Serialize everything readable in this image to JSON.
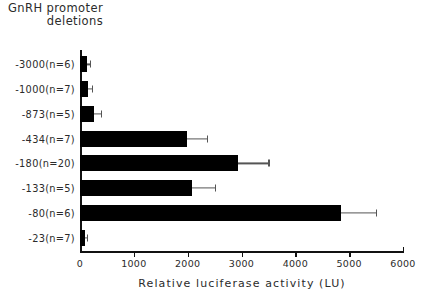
{
  "chart_data": {
    "type": "bar",
    "orientation": "horizontal",
    "title": "GnRH promoter deletions",
    "title_line1": "GnRH  promoter",
    "title_line2": "deletions",
    "xlabel": "Relative  luciferase  activity  (LU)",
    "ylabel": "",
    "xlim": [
      0,
      6000
    ],
    "xticks": [
      0,
      1000,
      2000,
      3000,
      4000,
      5000,
      6000
    ],
    "xtick_labels": [
      "0",
      "1000",
      "2000",
      "3000",
      "4000",
      "5000",
      "6000"
    ],
    "grid": false,
    "legend": null,
    "bar_color": "#000000",
    "error_color": "#555555",
    "categories": [
      "-3000(n=6)",
      "-1000(n=7)",
      "-873(n=5)",
      "-434(n=7)",
      "-180(n=20)",
      "-133(n=5)",
      "-80(n=6)",
      "-23(n=7)"
    ],
    "values": [
      130,
      140,
      260,
      1990,
      2940,
      2080,
      4850,
      90
    ],
    "errors": [
      60,
      75,
      130,
      370,
      560,
      430,
      650,
      40
    ],
    "bars": [
      {
        "label": "-3000(n=6)",
        "n": 6,
        "value": 130,
        "error": 60,
        "error_upper": 190
      },
      {
        "label": "-1000(n=7)",
        "n": 7,
        "value": 140,
        "error": 75,
        "error_upper": 215
      },
      {
        "label": "-873(n=5)",
        "n": 5,
        "value": 260,
        "error": 130,
        "error_upper": 390
      },
      {
        "label": "-434(n=7)",
        "n": 7,
        "value": 1990,
        "error": 370,
        "error_upper": 2360
      },
      {
        "label": "-180(n=20)",
        "n": 20,
        "value": 2940,
        "error": 560,
        "error_upper": 3500
      },
      {
        "label": "-133(n=5)",
        "n": 5,
        "value": 2080,
        "error": 430,
        "error_upper": 2510
      },
      {
        "label": "-80(n=6)",
        "n": 6,
        "value": 4850,
        "error": 650,
        "error_upper": 5500
      },
      {
        "label": "-23(n=7)",
        "n": 7,
        "value": 90,
        "error": 40,
        "error_upper": 130
      }
    ]
  }
}
